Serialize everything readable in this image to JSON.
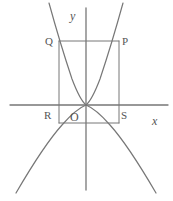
{
  "figure": {
    "type": "geometry-diagram",
    "width": 173,
    "height": 201,
    "background_color": "#ffffff",
    "stroke_color": "#777777",
    "label_color": "#555555"
  },
  "axes": {
    "x_axis": {
      "label": "x",
      "italic": true,
      "y_pixel": 105,
      "x_start": 10,
      "x_end": 168,
      "label_x": 152,
      "label_y": 115
    },
    "y_axis": {
      "label": "y",
      "italic": true,
      "x_pixel": 86,
      "y_start": 8,
      "y_end": 190,
      "label_x": 70,
      "label_y": 10
    },
    "origin": {
      "label": "O",
      "x_pixel": 86,
      "y_pixel": 105,
      "label_x": 70,
      "label_y": 111
    }
  },
  "points": [
    {
      "name": "Q",
      "label": "Q",
      "x": 59,
      "y": 41,
      "label_x": 45,
      "label_y": 36
    },
    {
      "name": "P",
      "label": "P",
      "x": 119,
      "y": 41,
      "label_x": 122,
      "label_y": 36
    },
    {
      "name": "R",
      "label": "R",
      "x": 59,
      "y": 123,
      "label_x": 44,
      "label_y": 110
    },
    {
      "name": "S",
      "label": "S",
      "x": 119,
      "y": 123,
      "label_x": 121,
      "label_y": 110
    }
  ],
  "rectangle": {
    "name": "PQRS",
    "left": 59,
    "right": 119,
    "top": 41,
    "bottom": 123
  },
  "curves": [
    {
      "name": "upward-parabola",
      "direction": "up",
      "vertex": {
        "x": 86,
        "y": 105
      },
      "path": "M 49 3 Q 60 43 72 79 Q 80 100 86 105 Q 92 100 100 79 Q 112 43 123 3"
    },
    {
      "name": "downward-parabola",
      "direction": "down",
      "vertex": {
        "x": 86,
        "y": 105
      },
      "path": "M 16 193 Q 44 145 62 125 Q 76 109 86 105 Q 96 109 110 125 Q 128 145 156 193"
    }
  ]
}
